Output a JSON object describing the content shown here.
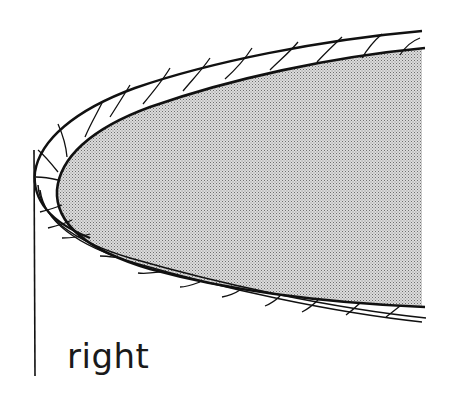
{
  "diagram": {
    "label": "right",
    "colors": {
      "stroke": "#111111",
      "fill_dots": "#8a8a8a",
      "fill_bg": "#d9d9d9",
      "background": "#ffffff"
    },
    "parts": [
      {
        "name": "shaded-core",
        "description": "stippled grey rounded body"
      },
      {
        "name": "wrapped-layer",
        "description": "spiral-wrapped band around the core"
      },
      {
        "name": "vertical-line",
        "description": "thin vertical reference line at left"
      }
    ]
  }
}
